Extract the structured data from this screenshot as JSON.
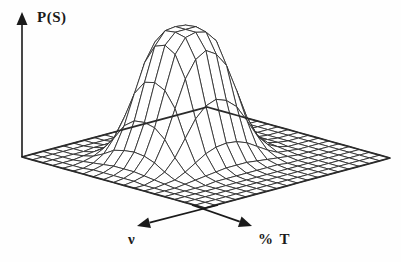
{
  "figure": {
    "title": "",
    "background_color": "#fefefe",
    "line_color": "#2b2b2b",
    "axis_color": "#1a1a1a"
  },
  "axes": {
    "vertical": {
      "label": "P(S)",
      "name": "probability-axis",
      "arrow": "up"
    },
    "left_horizontal": {
      "label": "ν",
      "name": "frequency-axis",
      "arrow": "down-left"
    },
    "right_horizontal": {
      "label": "% T",
      "name": "percent-transmittance-axis",
      "arrow": "down-right"
    }
  },
  "chart_data": {
    "type": "surface",
    "title": "",
    "xlabel": "% T",
    "ylabel": "ν",
    "zlabel": "P(S)",
    "grid": true,
    "legend": false,
    "nx": 19,
    "ny": 19,
    "xlim": [
      0,
      18
    ],
    "ylim": [
      0,
      18
    ],
    "zlim": [
      0,
      1
    ],
    "peak": {
      "center_x": 8.0,
      "center_y": 8.5,
      "amplitude": 1.0,
      "sigma_x": 3.4,
      "sigma_y": 3.2,
      "flatness_exponent": 2.6
    },
    "baseline": 0.0,
    "x": [
      0,
      1,
      2,
      3,
      4,
      5,
      6,
      7,
      8,
      9,
      10,
      11,
      12,
      13,
      14,
      15,
      16,
      17,
      18
    ],
    "y": [
      0,
      1,
      2,
      3,
      4,
      5,
      6,
      7,
      8,
      9,
      10,
      11,
      12,
      13,
      14,
      15,
      16,
      17,
      18
    ],
    "z": [
      [
        0.0,
        0.0,
        0.0,
        0.0,
        0.0,
        0.0,
        0.0,
        0.0,
        0.0,
        0.0,
        0.0,
        0.0,
        0.0,
        0.0,
        0.0,
        0.0,
        0.0,
        0.0,
        0.0
      ],
      [
        0.0,
        0.0,
        0.0,
        0.0,
        0.0,
        0.0,
        0.0,
        0.0,
        0.0,
        0.0,
        0.0,
        0.0,
        0.0,
        0.0,
        0.0,
        0.0,
        0.0,
        0.0,
        0.0
      ],
      [
        0.0,
        0.0,
        0.0,
        0.0,
        0.0,
        0.01,
        0.01,
        0.01,
        0.01,
        0.01,
        0.01,
        0.01,
        0.0,
        0.0,
        0.0,
        0.0,
        0.0,
        0.0,
        0.0
      ],
      [
        0.0,
        0.0,
        0.0,
        0.01,
        0.02,
        0.03,
        0.05,
        0.06,
        0.06,
        0.06,
        0.05,
        0.04,
        0.02,
        0.01,
        0.0,
        0.0,
        0.0,
        0.0,
        0.0
      ],
      [
        0.0,
        0.0,
        0.01,
        0.03,
        0.07,
        0.13,
        0.18,
        0.22,
        0.23,
        0.22,
        0.19,
        0.13,
        0.07,
        0.03,
        0.01,
        0.0,
        0.0,
        0.0,
        0.0
      ],
      [
        0.0,
        0.0,
        0.02,
        0.07,
        0.17,
        0.31,
        0.45,
        0.54,
        0.57,
        0.54,
        0.46,
        0.32,
        0.17,
        0.07,
        0.02,
        0.0,
        0.0,
        0.0,
        0.0
      ],
      [
        0.0,
        0.01,
        0.03,
        0.12,
        0.29,
        0.52,
        0.74,
        0.88,
        0.93,
        0.88,
        0.76,
        0.53,
        0.29,
        0.12,
        0.03,
        0.01,
        0.0,
        0.0,
        0.0
      ],
      [
        0.0,
        0.01,
        0.04,
        0.14,
        0.35,
        0.63,
        0.89,
        0.99,
        1.0,
        0.99,
        0.91,
        0.64,
        0.35,
        0.14,
        0.04,
        0.01,
        0.0,
        0.0,
        0.0
      ],
      [
        0.0,
        0.01,
        0.04,
        0.15,
        0.36,
        0.65,
        0.92,
        1.0,
        1.0,
        1.0,
        0.93,
        0.66,
        0.36,
        0.15,
        0.04,
        0.01,
        0.0,
        0.0,
        0.0
      ],
      [
        0.0,
        0.01,
        0.04,
        0.14,
        0.34,
        0.61,
        0.87,
        0.98,
        1.0,
        0.98,
        0.89,
        0.62,
        0.34,
        0.14,
        0.04,
        0.01,
        0.0,
        0.0,
        0.0
      ],
      [
        0.0,
        0.01,
        0.03,
        0.11,
        0.27,
        0.49,
        0.7,
        0.83,
        0.88,
        0.83,
        0.72,
        0.5,
        0.27,
        0.11,
        0.03,
        0.01,
        0.0,
        0.0,
        0.0
      ],
      [
        0.0,
        0.0,
        0.02,
        0.06,
        0.15,
        0.28,
        0.41,
        0.49,
        0.52,
        0.49,
        0.42,
        0.29,
        0.15,
        0.06,
        0.02,
        0.0,
        0.0,
        0.0,
        0.0
      ],
      [
        0.0,
        0.0,
        0.01,
        0.02,
        0.06,
        0.11,
        0.16,
        0.19,
        0.2,
        0.19,
        0.16,
        0.11,
        0.06,
        0.02,
        0.01,
        0.0,
        0.0,
        0.0,
        0.0
      ],
      [
        0.0,
        0.0,
        0.0,
        0.01,
        0.02,
        0.03,
        0.04,
        0.05,
        0.05,
        0.05,
        0.04,
        0.03,
        0.02,
        0.01,
        0.0,
        0.0,
        0.0,
        0.0,
        0.0
      ],
      [
        0.0,
        0.0,
        0.0,
        0.0,
        0.0,
        0.01,
        0.01,
        0.01,
        0.01,
        0.01,
        0.01,
        0.01,
        0.0,
        0.0,
        0.0,
        0.0,
        0.0,
        0.0,
        0.0
      ],
      [
        0.0,
        0.0,
        0.0,
        0.0,
        0.0,
        0.0,
        0.0,
        0.0,
        0.0,
        0.0,
        0.0,
        0.0,
        0.0,
        0.0,
        0.0,
        0.0,
        0.0,
        0.0,
        0.0
      ],
      [
        0.0,
        0.0,
        0.0,
        0.0,
        0.0,
        0.0,
        0.0,
        0.0,
        0.0,
        0.0,
        0.0,
        0.0,
        0.0,
        0.0,
        0.0,
        0.0,
        0.0,
        0.0,
        0.0
      ],
      [
        0.0,
        0.0,
        0.0,
        0.0,
        0.0,
        0.0,
        0.0,
        0.0,
        0.0,
        0.0,
        0.0,
        0.0,
        0.0,
        0.0,
        0.0,
        0.0,
        0.0,
        0.0,
        0.0
      ],
      [
        0.0,
        0.0,
        0.0,
        0.0,
        0.0,
        0.0,
        0.0,
        0.0,
        0.0,
        0.0,
        0.0,
        0.0,
        0.0,
        0.0,
        0.0,
        0.0,
        0.0,
        0.0,
        0.0
      ]
    ]
  }
}
